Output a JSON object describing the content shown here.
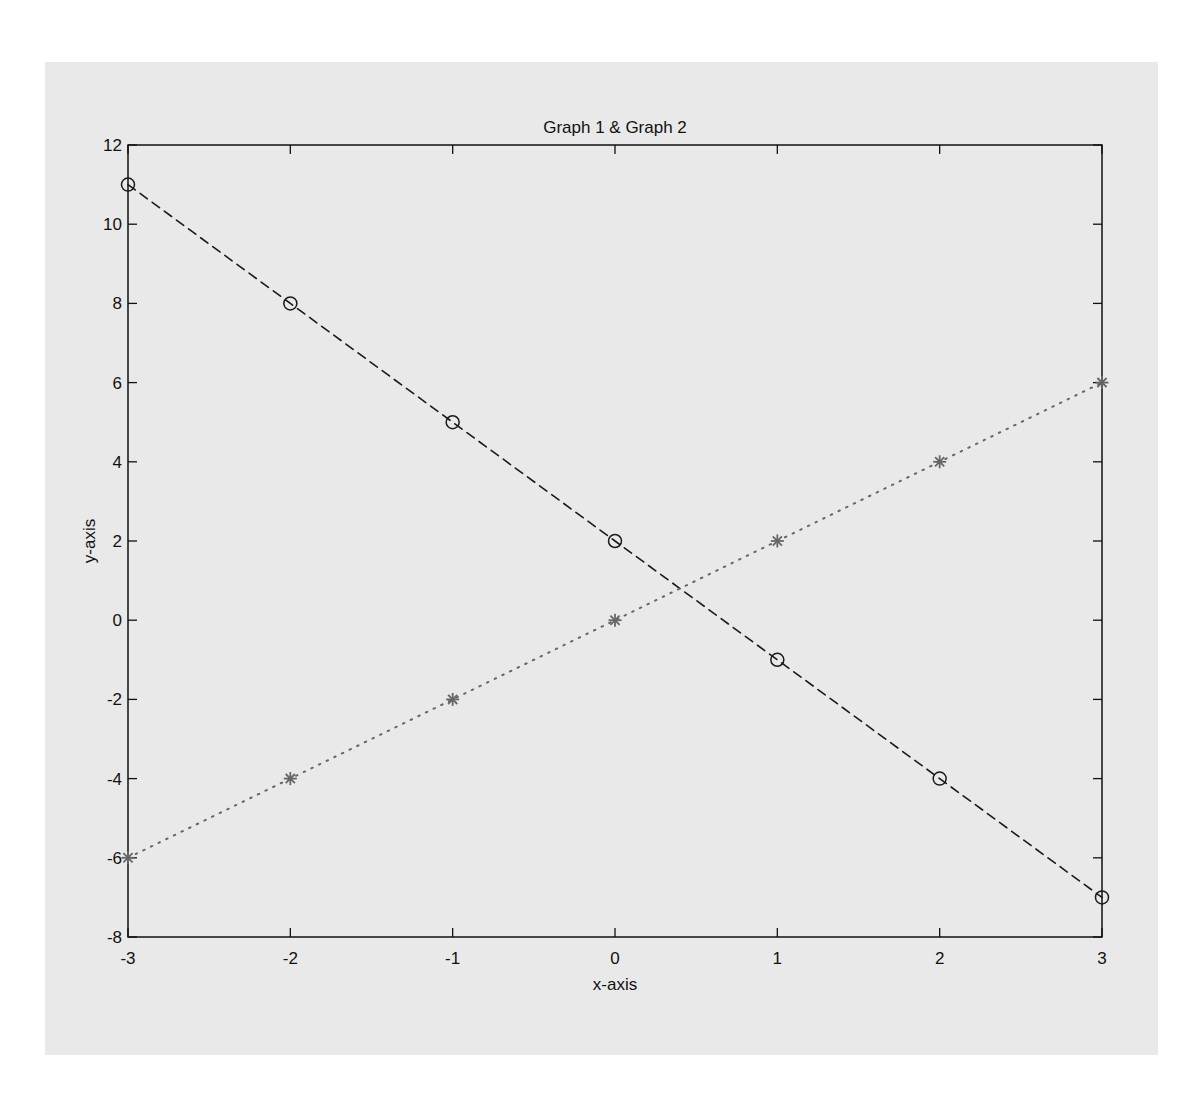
{
  "chart_data": {
    "type": "line",
    "title": "Graph 1 & Graph 2",
    "xlabel": "x-axis",
    "ylabel": "y-axis",
    "x": [
      -3,
      -2,
      -1,
      0,
      1,
      2,
      3
    ],
    "xlim": [
      -3,
      3
    ],
    "ylim": [
      -8,
      12
    ],
    "xticks": [
      -3,
      -2,
      -1,
      0,
      1,
      2,
      3
    ],
    "yticks": [
      -8,
      -6,
      -4,
      -2,
      0,
      2,
      4,
      6,
      8,
      10,
      12
    ],
    "grid": false,
    "legend": null,
    "series": [
      {
        "name": "Graph 1",
        "values": [
          11,
          8,
          5,
          2,
          -1,
          -4,
          -7
        ],
        "line_style": "dashed",
        "marker": "circle",
        "color": "#1a1a1a"
      },
      {
        "name": "Graph 2",
        "values": [
          -6,
          -4,
          -2,
          0,
          2,
          4,
          6
        ],
        "line_style": "dotted",
        "marker": "star",
        "color": "#666666"
      }
    ]
  },
  "colors": {
    "page_background": "#ffffff",
    "figure_background": "#e9e9e9",
    "axes_color": "#111111"
  }
}
